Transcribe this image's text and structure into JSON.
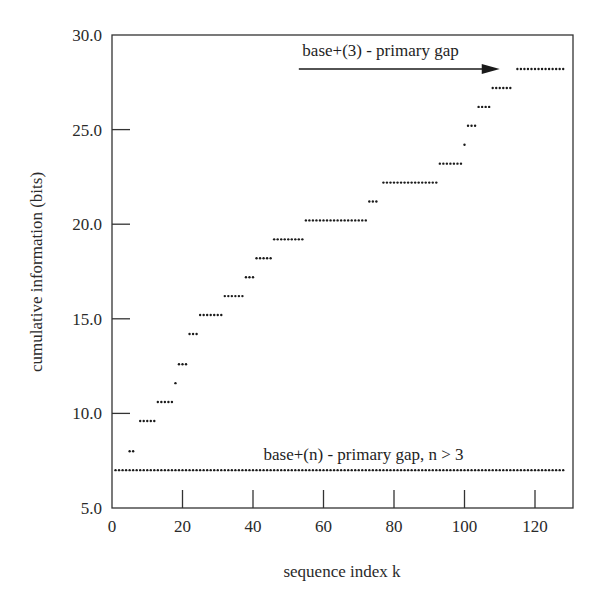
{
  "chart_data": {
    "type": "scatter",
    "title": "",
    "xlabel": "sequence index k",
    "ylabel": "cumulative information (bits)",
    "xlim": [
      0,
      131
    ],
    "ylim": [
      5.0,
      30.0
    ],
    "x_ticks": [
      0,
      20,
      40,
      60,
      80,
      100,
      120
    ],
    "x_tick_labels": [
      "0",
      "20",
      "40",
      "60",
      "80",
      "100",
      "120"
    ],
    "y_ticks": [
      5.0,
      10.0,
      15.0,
      20.0,
      25.0,
      30.0
    ],
    "y_tick_labels": [
      "5.0",
      "10.0",
      "15.0",
      "20.0",
      "25.0",
      "30.0"
    ],
    "grid": false,
    "legend": null,
    "annotations": [
      {
        "text": "base+(3) - primary gap",
        "x": 54,
        "y": 29.2,
        "arrow": {
          "from": [
            53,
            28.2
          ],
          "to": [
            110,
            28.2
          ]
        }
      },
      {
        "text": "base+(n) - primary gap, n > 3",
        "x": 43,
        "y": 7.8
      }
    ],
    "series": [
      {
        "name": "base+(3) - primary gap",
        "marker": "dot",
        "color": "#1a1a1a",
        "steps": [
          {
            "y": 8.0,
            "k_start": 5,
            "k_end": 6
          },
          {
            "y": 9.6,
            "k_start": 8,
            "k_end": 12
          },
          {
            "y": 10.6,
            "k_start": 13,
            "k_end": 17
          },
          {
            "y": 11.6,
            "k_start": 18,
            "k_end": 18
          },
          {
            "y": 12.6,
            "k_start": 19,
            "k_end": 21
          },
          {
            "y": 14.2,
            "k_start": 22,
            "k_end": 24
          },
          {
            "y": 15.2,
            "k_start": 25,
            "k_end": 31
          },
          {
            "y": 16.2,
            "k_start": 32,
            "k_end": 37
          },
          {
            "y": 17.2,
            "k_start": 38,
            "k_end": 40
          },
          {
            "y": 18.2,
            "k_start": 41,
            "k_end": 45
          },
          {
            "y": 19.2,
            "k_start": 46,
            "k_end": 54
          },
          {
            "y": 20.2,
            "k_start": 55,
            "k_end": 72
          },
          {
            "y": 21.2,
            "k_start": 73,
            "k_end": 75
          },
          {
            "y": 22.2,
            "k_start": 77,
            "k_end": 92
          },
          {
            "y": 23.2,
            "k_start": 93,
            "k_end": 99
          },
          {
            "y": 24.2,
            "k_start": 100,
            "k_end": 100
          },
          {
            "y": 25.2,
            "k_start": 101,
            "k_end": 103
          },
          {
            "y": 26.2,
            "k_start": 104,
            "k_end": 107
          },
          {
            "y": 27.2,
            "k_start": 108,
            "k_end": 113
          },
          {
            "y": 28.2,
            "k_start": 115,
            "k_end": 128
          }
        ]
      },
      {
        "name": "base+(n) - primary gap, n > 3",
        "marker": "dot",
        "color": "#1a1a1a",
        "steps": [
          {
            "y": 7.0,
            "k_start": 1,
            "k_end": 128
          }
        ]
      }
    ]
  },
  "labels": {
    "xlabel": "sequence index k",
    "ylabel": "cumulative information (bits)",
    "annot_top": "base+(3) - primary gap",
    "annot_bottom": "base+(n) - primary gap, n > 3"
  }
}
